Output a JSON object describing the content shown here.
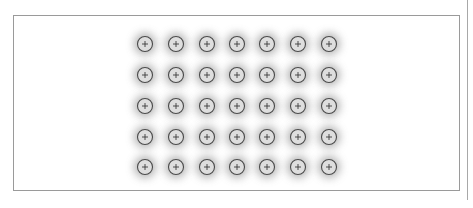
{
  "figure": {
    "grid": {
      "rows": 5,
      "columns": 7
    },
    "element_symbol": "plus-in-circle",
    "colors": {
      "background": "#ffffff",
      "frame": "#9a9a9a",
      "halo": "#9c9c9c",
      "element_fill": "#dedede",
      "element_stroke": "#4a4a4a",
      "plus": "#3a3a3a"
    }
  },
  "chart_data": {
    "type": "scatter",
    "title": "",
    "xlabel": "",
    "ylabel": "",
    "x": [
      145,
      176,
      207,
      237,
      267,
      298,
      329
    ],
    "y": [
      44,
      75,
      106,
      137,
      167
    ],
    "points_count": 35
  }
}
